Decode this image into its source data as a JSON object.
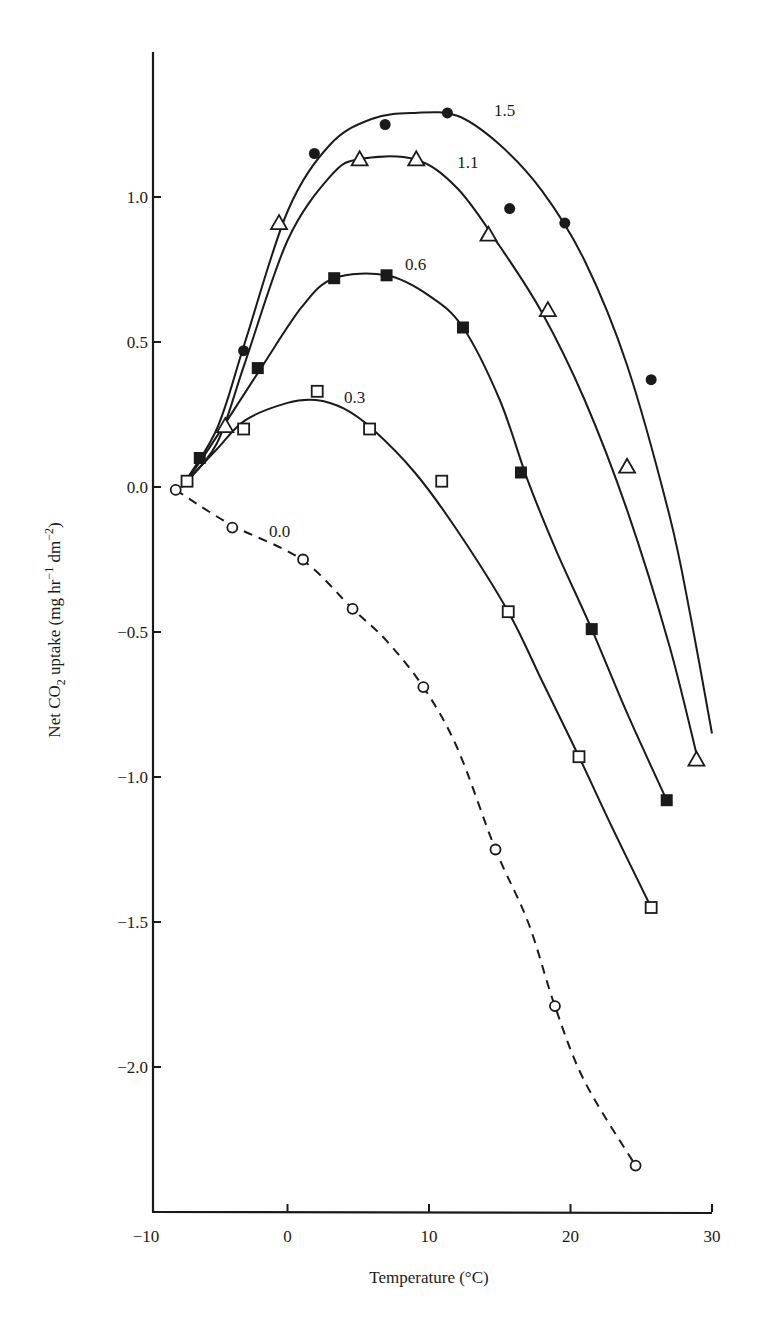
{
  "chart_data": {
    "type": "line",
    "title": "",
    "xlabel": "Temperature (°C)",
    "ylabel": "Net CO2 uptake (mg hr^-1 dm^-2)",
    "ylabel_parts": {
      "pre": "Net CO",
      "sub": "2",
      "mid": " uptake (mg hr",
      "sup1": "−1",
      "mid2": " dm",
      "sup2": "−2",
      "post": ")"
    },
    "xlim": [
      -10,
      30
    ],
    "ylim": [
      -2.5,
      1.5
    ],
    "x_ticks": [
      -10,
      0,
      10,
      20,
      30
    ],
    "x_tick_labels": [
      "−10",
      "0",
      "10",
      "20",
      "30"
    ],
    "y_ticks": [
      1.0,
      0.5,
      0.0,
      -0.5,
      -1.0,
      -1.5,
      -2.0
    ],
    "y_tick_labels": [
      "1.0",
      "0.5",
      "0.0",
      "−0.5",
      "−1.0",
      "−1.5",
      "−2.0"
    ],
    "grid": false,
    "legend": "inline curve labels",
    "series": [
      {
        "name": "1.5",
        "marker": "filled-circle",
        "line": "solid",
        "label_pos": [
          14.6,
          1.3
        ],
        "points": [
          [
            -3.1,
            0.47
          ],
          [
            1.9,
            1.15
          ],
          [
            6.9,
            1.25
          ],
          [
            11.3,
            1.29
          ],
          [
            15.7,
            0.96
          ],
          [
            19.6,
            0.91
          ],
          [
            25.7,
            0.37
          ]
        ],
        "fit": [
          [
            -7.5,
            0
          ],
          [
            -5,
            0.2
          ],
          [
            -3,
            0.5
          ],
          [
            0,
            0.95
          ],
          [
            3,
            1.18
          ],
          [
            6,
            1.27
          ],
          [
            9,
            1.29
          ],
          [
            12,
            1.28
          ],
          [
            15,
            1.18
          ],
          [
            18,
            1.02
          ],
          [
            21,
            0.78
          ],
          [
            24,
            0.42
          ],
          [
            27,
            -0.1
          ],
          [
            28.5,
            -0.45
          ],
          [
            30,
            -0.85
          ]
        ]
      },
      {
        "name": "1.1",
        "marker": "open-triangle",
        "line": "solid",
        "label_pos": [
          12.0,
          1.12
        ],
        "points": [
          [
            -4.4,
            0.21
          ],
          [
            -0.6,
            0.91
          ],
          [
            5.1,
            1.13
          ],
          [
            9.1,
            1.13
          ],
          [
            14.2,
            0.87
          ],
          [
            18.4,
            0.61
          ],
          [
            24.0,
            0.07
          ],
          [
            28.9,
            -0.94
          ]
        ],
        "fit": [
          [
            -7.5,
            0
          ],
          [
            -5,
            0.15
          ],
          [
            -3,
            0.43
          ],
          [
            0,
            0.85
          ],
          [
            3,
            1.07
          ],
          [
            5,
            1.13
          ],
          [
            9,
            1.13
          ],
          [
            12,
            1.03
          ],
          [
            15,
            0.83
          ],
          [
            18,
            0.6
          ],
          [
            21,
            0.3
          ],
          [
            24,
            -0.08
          ],
          [
            27,
            -0.55
          ],
          [
            29,
            -0.94
          ]
        ]
      },
      {
        "name": "0.6",
        "marker": "filled-square",
        "line": "solid",
        "label_pos": [
          8.3,
          0.77
        ],
        "points": [
          [
            -6.2,
            0.1
          ],
          [
            -2.1,
            0.41
          ],
          [
            3.3,
            0.72
          ],
          [
            7.0,
            0.73
          ],
          [
            12.4,
            0.55
          ],
          [
            16.5,
            0.05
          ],
          [
            21.5,
            -0.49
          ],
          [
            26.8,
            -1.08
          ]
        ],
        "fit": [
          [
            -7.5,
            0
          ],
          [
            -6,
            0.1
          ],
          [
            -2,
            0.4
          ],
          [
            1,
            0.62
          ],
          [
            3.3,
            0.72
          ],
          [
            7,
            0.73
          ],
          [
            10,
            0.66
          ],
          [
            12.4,
            0.55
          ],
          [
            15,
            0.3
          ],
          [
            17,
            0.02
          ],
          [
            19,
            -0.22
          ],
          [
            21.5,
            -0.49
          ],
          [
            24,
            -0.78
          ],
          [
            26.8,
            -1.08
          ]
        ]
      },
      {
        "name": "0.3",
        "marker": "open-square",
        "line": "solid",
        "label_pos": [
          4.0,
          0.31
        ],
        "points": [
          [
            -7.1,
            0.02
          ],
          [
            -3.1,
            0.2
          ],
          [
            2.1,
            0.33
          ],
          [
            5.8,
            0.2
          ],
          [
            10.9,
            0.02
          ],
          [
            15.6,
            -0.43
          ],
          [
            20.6,
            -0.93
          ],
          [
            25.7,
            -1.45
          ]
        ],
        "fit": [
          [
            -7.5,
            0
          ],
          [
            -5,
            0.13
          ],
          [
            -3,
            0.23
          ],
          [
            0,
            0.29
          ],
          [
            2,
            0.3
          ],
          [
            4,
            0.27
          ],
          [
            6,
            0.2
          ],
          [
            9,
            0.05
          ],
          [
            12,
            -0.15
          ],
          [
            15.6,
            -0.43
          ],
          [
            18,
            -0.67
          ],
          [
            20.6,
            -0.93
          ],
          [
            23,
            -1.18
          ],
          [
            25.7,
            -1.45
          ]
        ]
      },
      {
        "name": "0.0",
        "marker": "open-circle",
        "line": "dashed",
        "label_pos": [
          -1.3,
          -0.15
        ],
        "points": [
          [
            -7.9,
            -0.01
          ],
          [
            -3.9,
            -0.14
          ],
          [
            1.1,
            -0.25
          ],
          [
            4.6,
            -0.42
          ],
          [
            9.6,
            -0.69
          ],
          [
            14.7,
            -1.25
          ],
          [
            18.9,
            -1.79
          ],
          [
            24.6,
            -2.34
          ]
        ],
        "fit": [
          [
            -7.9,
            -0.01
          ],
          [
            -4,
            -0.13
          ],
          [
            1,
            -0.25
          ],
          [
            4.6,
            -0.42
          ],
          [
            7,
            -0.53
          ],
          [
            9.6,
            -0.69
          ],
          [
            12,
            -0.9
          ],
          [
            14.7,
            -1.25
          ],
          [
            17,
            -1.5
          ],
          [
            18.9,
            -1.79
          ],
          [
            21,
            -2.05
          ],
          [
            24.6,
            -2.34
          ]
        ]
      }
    ]
  },
  "style": {
    "ink": "#1a1a1a",
    "background": "#ffffff"
  }
}
